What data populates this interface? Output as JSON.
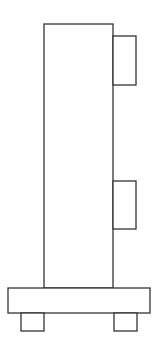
{
  "diagram": {
    "stroke_color": "#333333",
    "fill_color": "#ffffff",
    "shapes": {
      "body": {
        "x": 44,
        "y": 24,
        "w": 69,
        "h": 264
      },
      "tab_upper": {
        "x": 113,
        "y": 36,
        "w": 23,
        "h": 49
      },
      "tab_lower": {
        "x": 113,
        "y": 181,
        "w": 23,
        "h": 48
      },
      "base": {
        "x": 8,
        "y": 288,
        "w": 142,
        "h": 25
      },
      "foot_left": {
        "x": 21,
        "y": 313,
        "w": 23,
        "h": 18
      },
      "foot_right": {
        "x": 114,
        "y": 313,
        "w": 23,
        "h": 18
      }
    }
  }
}
